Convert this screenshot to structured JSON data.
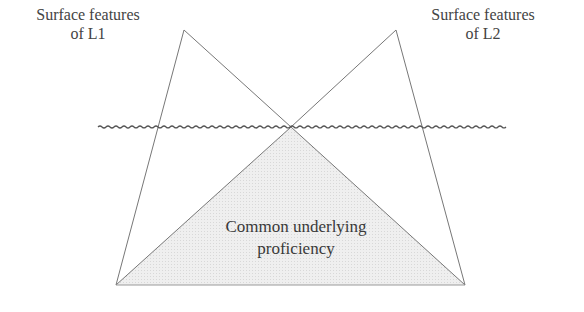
{
  "diagram": {
    "type": "iceberg / dual-iceberg model",
    "labels": {
      "l1_line1": "Surface features",
      "l1_line2": "of L1",
      "l2_line1": "Surface features",
      "l2_line2": "of L2",
      "cup_line1": "Common underlying",
      "cup_line2": "proficiency"
    },
    "colors": {
      "stroke": "#666666",
      "fill_shaded": "#ececec",
      "waterline": "#555555",
      "text": "#444444"
    }
  }
}
